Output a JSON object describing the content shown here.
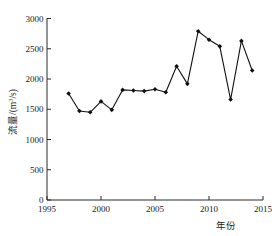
{
  "chart_data": {
    "type": "line",
    "title": "",
    "subtitle": "",
    "xlabel": "年份",
    "ylabel": "流量/(m³/s)",
    "ylabel_parts": {
      "prefix": "流量/(m",
      "exponent": "3",
      "suffix": "/s)"
    },
    "xlim": [
      1995,
      2015
    ],
    "ylim": [
      0,
      3000
    ],
    "grid": false,
    "legend": null,
    "x_ticks": [
      "1995",
      "2000",
      "2005",
      "2010",
      "2015"
    ],
    "x_tick_values": [
      1995,
      2000,
      2005,
      2010,
      2015
    ],
    "y_ticks": [
      "0",
      "500",
      "1000",
      "1500",
      "2000",
      "2500",
      "3000"
    ],
    "y_tick_values": [
      0,
      500,
      1000,
      1500,
      2000,
      2500,
      3000
    ],
    "x": [
      1997,
      1998,
      1999,
      2000,
      2001,
      2002,
      2003,
      2004,
      2005,
      2006,
      2007,
      2008,
      2009,
      2010,
      2011,
      2012,
      2013,
      2014
    ],
    "values": [
      1760,
      1470,
      1450,
      1630,
      1490,
      1820,
      1810,
      1800,
      1830,
      1780,
      2210,
      1920,
      2790,
      2650,
      2540,
      1660,
      2630,
      2140
    ],
    "series": [
      {
        "name": "流量",
        "x": [
          1997,
          1998,
          1999,
          2000,
          2001,
          2002,
          2003,
          2004,
          2005,
          2006,
          2007,
          2008,
          2009,
          2010,
          2011,
          2012,
          2013,
          2014
        ],
        "values": [
          1760,
          1470,
          1450,
          1630,
          1490,
          1820,
          1810,
          1800,
          1830,
          1780,
          2210,
          1920,
          2790,
          2650,
          2540,
          1660,
          2630,
          2140
        ],
        "marker": "diamond",
        "color": "#111111"
      }
    ],
    "annotations": []
  }
}
